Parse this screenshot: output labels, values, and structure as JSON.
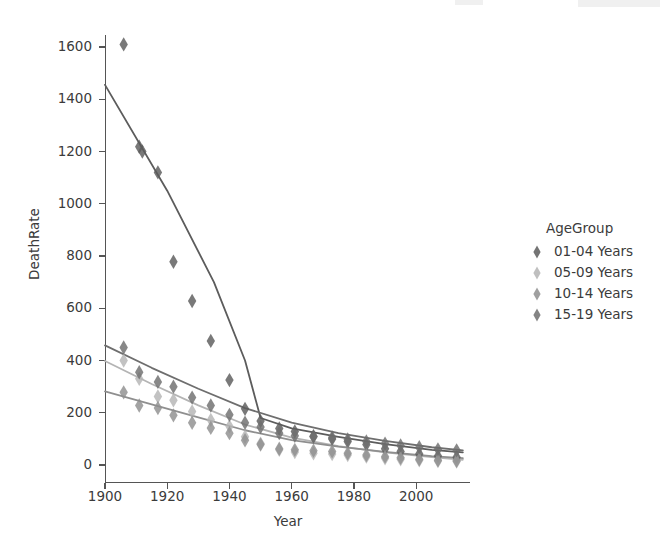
{
  "figure": {
    "background": "#ffffff",
    "axis_color": "#555555",
    "text_color": "#3b3b3b"
  },
  "axes": {
    "y_title": "DeathRate",
    "x_title": "Year",
    "y_ticks": [
      "0",
      "200",
      "400",
      "600",
      "800",
      "1000",
      "1200",
      "1400",
      "1600"
    ],
    "x_ticks": [
      "1900",
      "1920",
      "1940",
      "1960",
      "1980",
      "2000"
    ]
  },
  "legend": {
    "title": "AgeGroup",
    "items": [
      {
        "label": "01-04 Years",
        "color": "#5c5c5c",
        "marker": "diamond-marker"
      },
      {
        "label": "05-09 Years",
        "color": "#b4b4b4",
        "marker": "diamond-marker"
      },
      {
        "label": "10-14 Years",
        "color": "#8f8f8f",
        "marker": "diamond-marker"
      },
      {
        "label": "15-19 Years",
        "color": "#6e6e6e",
        "marker": "diamond-marker"
      }
    ]
  },
  "chart_data": {
    "type": "scatter",
    "title": "",
    "xlabel": "Year",
    "ylabel": "DeathRate",
    "xlim": [
      1898,
      2017
    ],
    "ylim": [
      -60,
      1680
    ],
    "grid": false,
    "legend_position": "right",
    "legend_title": "AgeGroup",
    "x_ticks": [
      1900,
      1920,
      1940,
      1960,
      1980,
      2000
    ],
    "y_ticks": [
      0,
      200,
      400,
      600,
      800,
      1000,
      1200,
      1400,
      1600
    ],
    "series": [
      {
        "name": "01-04 Years",
        "color": "#5c5c5c",
        "marker": "diamond",
        "points": [
          {
            "x": 1906,
            "y": 1610
          },
          {
            "x": 1911,
            "y": 1218
          },
          {
            "x": 1912,
            "y": 1200
          },
          {
            "x": 1917,
            "y": 1120
          },
          {
            "x": 1922,
            "y": 778
          },
          {
            "x": 1928,
            "y": 628
          },
          {
            "x": 1934,
            "y": 475
          },
          {
            "x": 1940,
            "y": 325
          },
          {
            "x": 1945,
            "y": 215
          },
          {
            "x": 1950,
            "y": 168
          },
          {
            "x": 1956,
            "y": 140
          },
          {
            "x": 1961,
            "y": 128
          },
          {
            "x": 1967,
            "y": 110
          },
          {
            "x": 1973,
            "y": 100
          },
          {
            "x": 1978,
            "y": 90
          },
          {
            "x": 1984,
            "y": 78
          },
          {
            "x": 1990,
            "y": 62
          },
          {
            "x": 1995,
            "y": 52
          },
          {
            "x": 2001,
            "y": 42
          },
          {
            "x": 2007,
            "y": 34
          },
          {
            "x": 2013,
            "y": 30
          }
        ],
        "fit_line": [
          {
            "x": 1900,
            "y": 1455
          },
          {
            "x": 1920,
            "y": 1050
          },
          {
            "x": 1935,
            "y": 700
          },
          {
            "x": 1945,
            "y": 400
          },
          {
            "x": 1950,
            "y": 180
          },
          {
            "x": 1960,
            "y": 140
          },
          {
            "x": 1975,
            "y": 108
          },
          {
            "x": 1990,
            "y": 80
          },
          {
            "x": 2005,
            "y": 58
          },
          {
            "x": 2015,
            "y": 48
          }
        ]
      },
      {
        "name": "05-09 Years",
        "color": "#b4b4b4",
        "marker": "diamond",
        "points": [
          {
            "x": 1906,
            "y": 400
          },
          {
            "x": 1911,
            "y": 330
          },
          {
            "x": 1917,
            "y": 262
          },
          {
            "x": 1922,
            "y": 248
          },
          {
            "x": 1928,
            "y": 205
          },
          {
            "x": 1934,
            "y": 172
          },
          {
            "x": 1940,
            "y": 148
          },
          {
            "x": 1945,
            "y": 108
          },
          {
            "x": 1950,
            "y": 82
          },
          {
            "x": 1956,
            "y": 58
          },
          {
            "x": 1961,
            "y": 50
          },
          {
            "x": 1967,
            "y": 45
          },
          {
            "x": 1973,
            "y": 42
          },
          {
            "x": 1978,
            "y": 38
          },
          {
            "x": 1984,
            "y": 32
          },
          {
            "x": 1990,
            "y": 26
          },
          {
            "x": 1995,
            "y": 22
          },
          {
            "x": 2001,
            "y": 18
          },
          {
            "x": 2007,
            "y": 15
          },
          {
            "x": 2013,
            "y": 13
          }
        ],
        "fit_line": [
          {
            "x": 1900,
            "y": 398
          },
          {
            "x": 1915,
            "y": 310
          },
          {
            "x": 1930,
            "y": 228
          },
          {
            "x": 1945,
            "y": 155
          },
          {
            "x": 1960,
            "y": 105
          },
          {
            "x": 1975,
            "y": 72
          },
          {
            "x": 1990,
            "y": 48
          },
          {
            "x": 2005,
            "y": 30
          },
          {
            "x": 2015,
            "y": 20
          }
        ]
      },
      {
        "name": "10-14 Years",
        "color": "#8f8f8f",
        "marker": "diamond",
        "points": [
          {
            "x": 1906,
            "y": 278
          },
          {
            "x": 1911,
            "y": 228
          },
          {
            "x": 1917,
            "y": 218
          },
          {
            "x": 1922,
            "y": 190
          },
          {
            "x": 1928,
            "y": 162
          },
          {
            "x": 1934,
            "y": 142
          },
          {
            "x": 1940,
            "y": 122
          },
          {
            "x": 1945,
            "y": 95
          },
          {
            "x": 1950,
            "y": 78
          },
          {
            "x": 1956,
            "y": 62
          },
          {
            "x": 1961,
            "y": 58
          },
          {
            "x": 1967,
            "y": 55
          },
          {
            "x": 1973,
            "y": 52
          },
          {
            "x": 1978,
            "y": 45
          },
          {
            "x": 1984,
            "y": 38
          },
          {
            "x": 1990,
            "y": 32
          },
          {
            "x": 1995,
            "y": 28
          },
          {
            "x": 2001,
            "y": 22
          },
          {
            "x": 2007,
            "y": 18
          },
          {
            "x": 2013,
            "y": 16
          }
        ],
        "fit_line": [
          {
            "x": 1900,
            "y": 282
          },
          {
            "x": 1915,
            "y": 232
          },
          {
            "x": 1930,
            "y": 182
          },
          {
            "x": 1945,
            "y": 133
          },
          {
            "x": 1960,
            "y": 95
          },
          {
            "x": 1975,
            "y": 70
          },
          {
            "x": 1990,
            "y": 50
          },
          {
            "x": 2005,
            "y": 34
          },
          {
            "x": 2015,
            "y": 26
          }
        ]
      },
      {
        "name": "15-19 Years",
        "color": "#6e6e6e",
        "marker": "diamond",
        "points": [
          {
            "x": 1906,
            "y": 450
          },
          {
            "x": 1911,
            "y": 355
          },
          {
            "x": 1917,
            "y": 318
          },
          {
            "x": 1922,
            "y": 300
          },
          {
            "x": 1928,
            "y": 258
          },
          {
            "x": 1934,
            "y": 228
          },
          {
            "x": 1940,
            "y": 192
          },
          {
            "x": 1945,
            "y": 162
          },
          {
            "x": 1950,
            "y": 145
          },
          {
            "x": 1956,
            "y": 122
          },
          {
            "x": 1961,
            "y": 112
          },
          {
            "x": 1967,
            "y": 108
          },
          {
            "x": 1973,
            "y": 105
          },
          {
            "x": 1978,
            "y": 98
          },
          {
            "x": 1984,
            "y": 90
          },
          {
            "x": 1990,
            "y": 82
          },
          {
            "x": 1995,
            "y": 75
          },
          {
            "x": 2001,
            "y": 68
          },
          {
            "x": 2007,
            "y": 60
          },
          {
            "x": 2013,
            "y": 56
          }
        ],
        "fit_line": [
          {
            "x": 1900,
            "y": 458
          },
          {
            "x": 1915,
            "y": 372
          },
          {
            "x": 1930,
            "y": 292
          },
          {
            "x": 1945,
            "y": 218
          },
          {
            "x": 1960,
            "y": 162
          },
          {
            "x": 1975,
            "y": 122
          },
          {
            "x": 1990,
            "y": 92
          },
          {
            "x": 2005,
            "y": 68
          },
          {
            "x": 2015,
            "y": 56
          }
        ]
      }
    ]
  }
}
